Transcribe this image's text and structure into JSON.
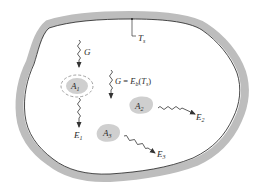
{
  "diagram": {
    "type": "enclosure-radiation",
    "colors": {
      "wall_fill": "#bdbdbd",
      "wall_inner_line": "#1a1a1a",
      "body_fill": "#cfcfcf",
      "arrow": "#333333",
      "text": "#2a2a2a",
      "background": "#ffffff"
    },
    "enclosure": {
      "surface_temperature_label": {
        "main": "T",
        "sub": "s"
      }
    },
    "irradiation": {
      "label": "G",
      "equation": {
        "lhs": "G",
        "eq": " = ",
        "func": "E",
        "func_sub": "b",
        "arg_open": "(",
        "arg": "T",
        "arg_sub": "s",
        "arg_close": ")"
      }
    },
    "bodies": [
      {
        "id": "A1",
        "main": "A",
        "sub": "1",
        "emission": {
          "main": "E",
          "sub": "1"
        },
        "control_surface": "dashed"
      },
      {
        "id": "A2",
        "main": "A",
        "sub": "2",
        "emission": {
          "main": "E",
          "sub": "2"
        }
      },
      {
        "id": "A3",
        "main": "A",
        "sub": "3",
        "emission": {
          "main": "E",
          "sub": "3"
        }
      }
    ]
  }
}
